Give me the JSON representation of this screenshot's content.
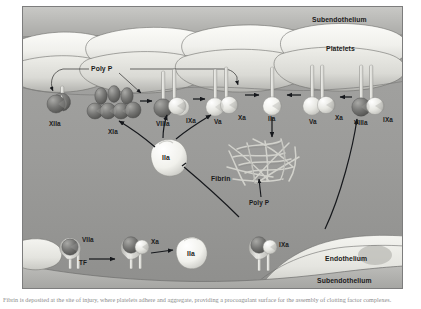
{
  "figure": {
    "caption": "Fibrin is deposited at the site of injury, where platelets adhere and aggregate, providing a procoagulant surface for the assembly of clotting factor complexes."
  },
  "regions": {
    "subendothelium_top": "Subendothelium",
    "platelets": "Platelets",
    "endothelium": "Endothelium",
    "subendothelium_bottom": "Subendothelium"
  },
  "annotations": {
    "poly_p_top": "Poly P",
    "poly_p_fibrin": "Poly P",
    "fibrin": "Fibrin"
  },
  "factors": {
    "xiia": "XIIa",
    "xia": "XIa",
    "viiia_left": "VIIIa",
    "ixa_left": "IXa",
    "va_left": "Va",
    "xa_left": "Xa",
    "iia_platelet": "IIa",
    "va_right": "Va",
    "xa_right": "Xa",
    "viiia_right": "VIIIa",
    "ixa_right": "IXa",
    "iia_center": "IIa",
    "viia_bottom": "VIIa",
    "tf_bottom": "TF",
    "xa_bottom": "Xa",
    "iia_bottom": "IIa",
    "ixa_bottom": "IXa"
  },
  "colors": {
    "plasma_bg": "#9a9a9a",
    "platelet_fill": "#f2f2ee",
    "platelet_shadow": "#b9b9b5",
    "factor_dark": "#6d6d6d",
    "factor_light": "#e9e9e4",
    "membrane_stalk": "#dcdcd6",
    "arrow": "#16181c",
    "fibrin_strand": "#cfcfc9",
    "endothelium_fill": "#ececE6",
    "subendothelium_bottom_fill": "#b0b0ac",
    "label_text": "#1b1b1b",
    "frame_border": "#7d7d7d"
  }
}
